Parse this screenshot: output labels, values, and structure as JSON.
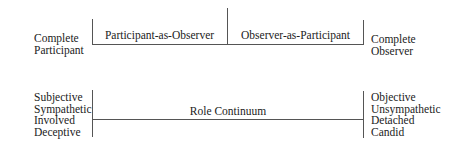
{
  "top_row": {
    "left_end": {
      "line1": "Complete",
      "line2": "Participant"
    },
    "segments": [
      {
        "label": "Participant-as-Observer"
      },
      {
        "label": "Observer-as-Participant"
      }
    ],
    "right_end": {
      "line1": "Complete",
      "line2": "Observer"
    }
  },
  "bottom_row": {
    "left_attributes": [
      "Subjective",
      "Sympathetic",
      "Involved",
      "Deceptive"
    ],
    "center_label": "Role Continuum",
    "right_attributes": [
      "Objective",
      "Unsympathetic",
      "Detached",
      "Candid"
    ]
  },
  "colors": {
    "line": "#555555",
    "text": "#222222",
    "background": "#ffffff"
  }
}
